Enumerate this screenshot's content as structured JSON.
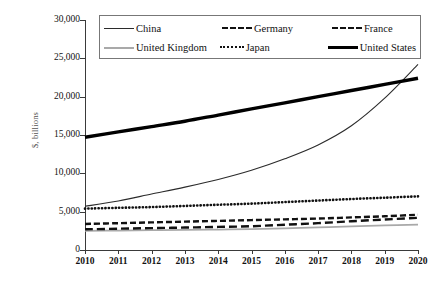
{
  "chart_data": {
    "type": "line",
    "title": "",
    "subtitle": "",
    "xlabel": "",
    "ylabel": "$, billions",
    "x": [
      2010,
      2011,
      2012,
      2013,
      2014,
      2015,
      2016,
      2017,
      2018,
      2019,
      2020
    ],
    "categories": [
      "2010",
      "2011",
      "2012",
      "2013",
      "2014",
      "2015",
      "2016",
      "2017",
      "2018",
      "2019",
      "2020"
    ],
    "xlim": [
      2010,
      2020
    ],
    "ylim": [
      0,
      30000
    ],
    "ytick_values": [
      0,
      5000,
      10000,
      15000,
      20000,
      25000,
      30000
    ],
    "ytick_labels": [
      "0",
      "5,000",
      "10,000",
      "15,000",
      "20,000",
      "25,000",
      "30,000"
    ],
    "grid": false,
    "legend_position": "top-center",
    "annotations": [],
    "series": [
      {
        "name": "China",
        "style": "solid-thin",
        "color": "#2b2b2b",
        "values": [
          5700,
          6400,
          7300,
          8200,
          9200,
          10400,
          11900,
          13700,
          16200,
          19800,
          24200
        ]
      },
      {
        "name": "Germany",
        "style": "dashed",
        "color": "#111111",
        "values": [
          3400,
          3500,
          3600,
          3700,
          3800,
          3900,
          4000,
          4100,
          4250,
          4400,
          4600
        ]
      },
      {
        "name": "France",
        "style": "dashed-long",
        "color": "#111111",
        "values": [
          2700,
          2780,
          2850,
          2930,
          3010,
          3100,
          3300,
          3500,
          3750,
          3980,
          4200
        ]
      },
      {
        "name": "United Kingdom",
        "style": "solid-gray",
        "color": "#a9a9a9",
        "values": [
          2500,
          2540,
          2580,
          2620,
          2670,
          2720,
          2820,
          2950,
          3080,
          3200,
          3300
        ]
      },
      {
        "name": "Japan",
        "style": "dotted",
        "color": "#111111",
        "values": [
          5400,
          5500,
          5600,
          5750,
          5900,
          6050,
          6250,
          6450,
          6650,
          6820,
          7000
        ]
      },
      {
        "name": "United States",
        "style": "solid-thick",
        "color": "#000000",
        "values": [
          14700,
          15400,
          16100,
          16800,
          17600,
          18400,
          19200,
          20000,
          20800,
          21600,
          22400
        ]
      }
    ]
  },
  "legend": {
    "items": [
      {
        "label": "China",
        "icon": "line-solid-thin-icon"
      },
      {
        "label": "Germany",
        "icon": "line-dashed-icon"
      },
      {
        "label": "France",
        "icon": "line-dashed-long-icon"
      },
      {
        "label": "United Kingdom",
        "icon": "line-solid-gray-icon"
      },
      {
        "label": "Japan",
        "icon": "line-dotted-icon"
      },
      {
        "label": "United States",
        "icon": "line-solid-thick-icon"
      }
    ]
  }
}
